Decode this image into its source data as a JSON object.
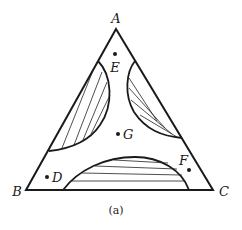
{
  "figure": {
    "caption": "(a)",
    "type": "ternary phase diagram",
    "vertices": [
      {
        "id": "A",
        "label": "A"
      },
      {
        "id": "B",
        "label": "B"
      },
      {
        "id": "C",
        "label": "C"
      }
    ],
    "points": [
      {
        "id": "E",
        "label": "E"
      },
      {
        "id": "G",
        "label": "G"
      },
      {
        "id": "D",
        "label": "D"
      },
      {
        "id": "F",
        "label": "F"
      }
    ],
    "regions": [
      {
        "id": "two-phase-AB",
        "description": "two-phase region with tie lines near edge AB"
      },
      {
        "id": "two-phase-AC",
        "description": "two-phase region with tie lines near edge AC"
      },
      {
        "id": "two-phase-BC",
        "description": "two-phase region with tie lines near edge BC"
      }
    ]
  }
}
